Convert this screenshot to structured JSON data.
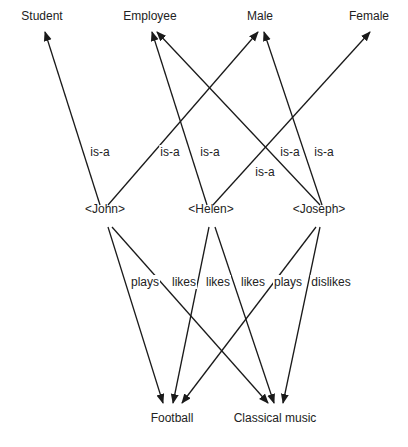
{
  "nodes": {
    "student": {
      "label": "Student",
      "x": 42,
      "y": 17
    },
    "employee": {
      "label": "Employee",
      "x": 150,
      "y": 17
    },
    "male": {
      "label": "Male",
      "x": 260,
      "y": 17
    },
    "female": {
      "label": "Female",
      "x": 369,
      "y": 17
    },
    "john": {
      "label": "<John>",
      "x": 105,
      "y": 210
    },
    "helen": {
      "label": "<Helen>",
      "x": 211,
      "y": 210
    },
    "joseph": {
      "label": "<Joseph>",
      "x": 319,
      "y": 210
    },
    "football": {
      "label": "Football",
      "x": 172,
      "y": 419
    },
    "classical": {
      "label": "Classical music",
      "x": 275,
      "y": 419
    }
  },
  "edge_labels": [
    {
      "label": "is-a",
      "x": 100,
      "y": 153
    },
    {
      "label": "is-a",
      "x": 170,
      "y": 153
    },
    {
      "label": "is-a",
      "x": 210,
      "y": 153
    },
    {
      "label": "is-a",
      "x": 290,
      "y": 153
    },
    {
      "label": "is-a",
      "x": 324,
      "y": 153
    },
    {
      "label": "is-a",
      "x": 265,
      "y": 173
    },
    {
      "label": "plays",
      "x": 145,
      "y": 283
    },
    {
      "label": "likes",
      "x": 184,
      "y": 283
    },
    {
      "label": "likes",
      "x": 218,
      "y": 283
    },
    {
      "label": "likes",
      "x": 253,
      "y": 283
    },
    {
      "label": "plays",
      "x": 288,
      "y": 283
    },
    {
      "label": "dislikes",
      "x": 331,
      "y": 283
    }
  ],
  "edges": [
    {
      "from": [
        100,
        205
      ],
      "to": [
        45,
        32
      ],
      "label": "is-a"
    },
    {
      "from": [
        108,
        205
      ],
      "to": [
        258,
        32
      ],
      "label": "is-a"
    },
    {
      "from": [
        207,
        205
      ],
      "to": [
        152,
        32
      ],
      "label": "is-a"
    },
    {
      "from": [
        213,
        205
      ],
      "to": [
        370,
        32
      ],
      "label": "is-a"
    },
    {
      "from": [
        320,
        205
      ],
      "to": [
        157,
        32
      ],
      "label": "is-a"
    },
    {
      "from": [
        322,
        205
      ],
      "to": [
        264,
        32
      ],
      "label": "is-a"
    },
    {
      "from": [
        108,
        227
      ],
      "to": [
        163,
        403
      ],
      "label": "plays"
    },
    {
      "from": [
        112,
        227
      ],
      "to": [
        268,
        403
      ],
      "label": "likes"
    },
    {
      "from": [
        209,
        227
      ],
      "to": [
        173,
        403
      ],
      "label": "likes"
    },
    {
      "from": [
        215,
        227
      ],
      "to": [
        274,
        403
      ],
      "label": "likes"
    },
    {
      "from": [
        316,
        227
      ],
      "to": [
        182,
        403
      ],
      "label": "plays"
    },
    {
      "from": [
        320,
        227
      ],
      "to": [
        283,
        403
      ],
      "label": "dislikes"
    }
  ]
}
